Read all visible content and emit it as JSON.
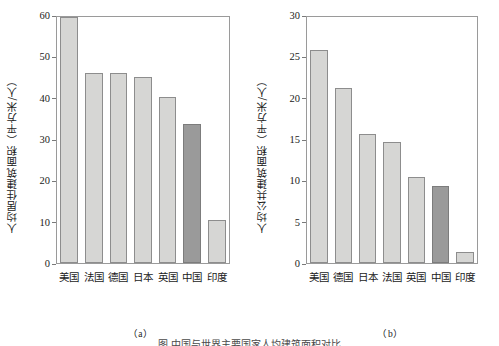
{
  "figure": {
    "caption": "图  中国与世界主要国家人均建筑面积对比"
  },
  "panels": [
    {
      "key": "a",
      "sub_caption": "（a）",
      "ylabel": "人均居住建筑面积（平方米/人）",
      "yticks": [
        "0",
        "10",
        "20",
        "30",
        "40",
        "50",
        "60"
      ]
    },
    {
      "key": "b",
      "sub_caption": "（b）",
      "ylabel": "人均公共建筑面积（平方米/人）",
      "yticks": [
        "0",
        "5",
        "10",
        "15",
        "20",
        "25",
        "30"
      ]
    }
  ],
  "chart_data": [
    {
      "type": "bar",
      "panel": "a",
      "title": "",
      "xlabel": "",
      "ylabel": "人均居住建筑面积（平方米/人）",
      "ylim": [
        0,
        60
      ],
      "ytick_step": 10,
      "grid": false,
      "legend": "none",
      "categories": [
        "美国",
        "法国",
        "德国",
        "日本",
        "英国",
        "中国",
        "印度"
      ],
      "values": [
        60.0,
        46.3,
        46.3,
        45.3,
        40.5,
        34.0,
        10.5
      ],
      "highlight_index": 5,
      "colors": {
        "bar": "#d6d6d4",
        "bar_highlight": "#9a9a9a",
        "bar_edge": "#8d8d8d",
        "axis": "#9a9a9a"
      }
    },
    {
      "type": "bar",
      "panel": "b",
      "title": "",
      "xlabel": "",
      "ylabel": "人均公共建筑面积（平方米/人）",
      "ylim": [
        0,
        30
      ],
      "ytick_step": 5,
      "grid": false,
      "legend": "none",
      "categories": [
        "美国",
        "德国",
        "日本",
        "法国",
        "英国",
        "中国",
        "印度"
      ],
      "values": [
        26.0,
        21.4,
        15.7,
        14.8,
        10.5,
        9.4,
        1.3
      ],
      "highlight_index": 5,
      "colors": {
        "bar": "#d6d6d4",
        "bar_highlight": "#9a9a9a",
        "bar_edge": "#8d8d8d",
        "axis": "#9a9a9a"
      }
    }
  ]
}
